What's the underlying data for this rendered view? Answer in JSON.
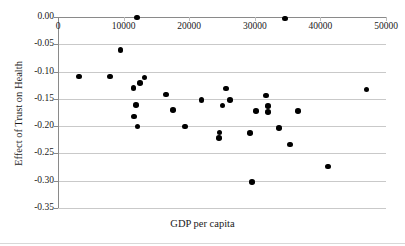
{
  "chart_data": {
    "type": "scatter",
    "title": "",
    "xlabel": "GDP per capita",
    "ylabel": "Effect of Trust on Health",
    "xlim": [
      0,
      50000
    ],
    "ylim": [
      -0.35,
      0.0
    ],
    "xticks": [
      0,
      10000,
      20000,
      30000,
      40000,
      50000
    ],
    "xtick_labels": [
      "0",
      "10000",
      "20000",
      "30000",
      "40000",
      "50000"
    ],
    "yticks": [
      0.0,
      -0.05,
      -0.1,
      -0.15,
      -0.2,
      -0.25,
      -0.3,
      -0.35
    ],
    "ytick_labels": [
      "0.00",
      "-0.05",
      "-0.10",
      "-0.15",
      "-0.20",
      "-0.25",
      "-0.30",
      "-0.35"
    ],
    "grid": "horizontal",
    "legend": null,
    "marker": "filled-circle",
    "marker_color": "#000000",
    "points": [
      {
        "x": 12000,
        "y": -0.001
      },
      {
        "x": 34600,
        "y": -0.003
      },
      {
        "x": 9500,
        "y": -0.061
      },
      {
        "x": 3200,
        "y": -0.109
      },
      {
        "x": 7900,
        "y": -0.109
      },
      {
        "x": 13200,
        "y": -0.111
      },
      {
        "x": 11500,
        "y": -0.13
      },
      {
        "x": 12500,
        "y": -0.121
      },
      {
        "x": 47000,
        "y": -0.133
      },
      {
        "x": 25600,
        "y": -0.131
      },
      {
        "x": 16500,
        "y": -0.142
      },
      {
        "x": 31700,
        "y": -0.144
      },
      {
        "x": 21900,
        "y": -0.152
      },
      {
        "x": 26200,
        "y": -0.152
      },
      {
        "x": 11900,
        "y": -0.161
      },
      {
        "x": 32000,
        "y": -0.163
      },
      {
        "x": 25100,
        "y": -0.162
      },
      {
        "x": 17500,
        "y": -0.17
      },
      {
        "x": 30200,
        "y": -0.172
      },
      {
        "x": 36600,
        "y": -0.172
      },
      {
        "x": 32000,
        "y": -0.174
      },
      {
        "x": 11600,
        "y": -0.182
      },
      {
        "x": 12100,
        "y": -0.201
      },
      {
        "x": 19400,
        "y": -0.201
      },
      {
        "x": 33700,
        "y": -0.203
      },
      {
        "x": 24600,
        "y": -0.212
      },
      {
        "x": 29300,
        "y": -0.213
      },
      {
        "x": 24500,
        "y": -0.222
      },
      {
        "x": 35400,
        "y": -0.234
      },
      {
        "x": 41200,
        "y": -0.274
      },
      {
        "x": 29600,
        "y": -0.302
      }
    ]
  }
}
